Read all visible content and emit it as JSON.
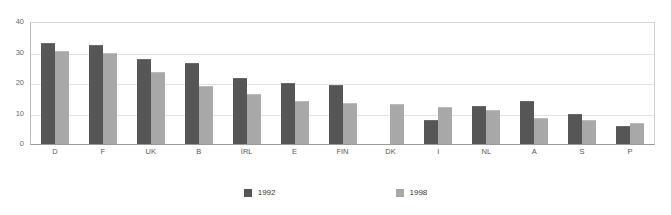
{
  "chart_data": {
    "type": "bar",
    "title": "",
    "subtitle": "",
    "xlabel": "",
    "ylabel": "",
    "ylim": [
      0,
      40
    ],
    "yticks": [
      0,
      10,
      20,
      30,
      40
    ],
    "grid": true,
    "legend_position": "bottom",
    "categories": [
      "D",
      "F",
      "UK",
      "B",
      "IRL",
      "E",
      "FIN",
      "DK",
      "I",
      "NL",
      "A",
      "S",
      "P"
    ],
    "series": [
      {
        "name": "1992",
        "color": "#565656",
        "values": [
          33,
          32.5,
          28,
          26.5,
          21.5,
          20,
          19.5,
          null,
          8,
          12.5,
          14,
          10,
          6
        ]
      },
      {
        "name": "1998",
        "color": "#a8a8a8",
        "values": [
          30.5,
          30,
          23.5,
          19,
          16.5,
          14,
          13.5,
          13,
          12,
          11,
          8.5,
          8,
          7
        ]
      }
    ]
  },
  "axes": {
    "y_tick_labels": [
      "0",
      "10",
      "20",
      "30",
      "40"
    ]
  },
  "legend": {
    "entries": [
      {
        "label": "1992",
        "swatch": "legend-swatch-1992"
      },
      {
        "label": "1998",
        "swatch": "legend-swatch-1998"
      }
    ]
  }
}
